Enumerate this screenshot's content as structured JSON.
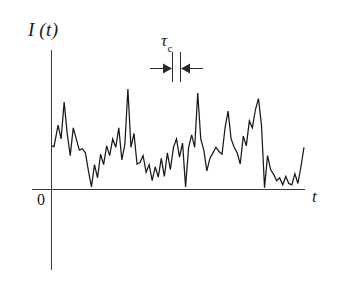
{
  "figure": {
    "background_color": "#ffffff",
    "axis_color": "#3a3a3a",
    "trace_color": "#1a1a1a",
    "labels": {
      "y_axis": "I (t)",
      "x_axis": "t",
      "origin": "0",
      "tau_symbol": "τ",
      "tau_subscript": "c"
    }
  },
  "chart_data": {
    "type": "line",
    "title": "",
    "xlabel": "t",
    "ylabel": "I (t)",
    "subtitle": "",
    "grid": false,
    "legend": null,
    "xlim": [
      0,
      100
    ],
    "ylim": [
      0,
      100
    ],
    "annotations": [
      {
        "label": "τc",
        "description": "coherence time interval marked between two vertical bars with inward-pointing arrows",
        "x_start": 57.0,
        "x_end": 60.3,
        "y": 96
      }
    ],
    "series": [
      {
        "name": "I(t)",
        "x": [
          0.0,
          0.8,
          2.4,
          3.6,
          4.8,
          6.0,
          7.2,
          8.4,
          9.6,
          10.8,
          12.0,
          13.2,
          14.4,
          15.6,
          16.8,
          18.0,
          19.2,
          20.4,
          21.6,
          22.8,
          24.0,
          25.2,
          26.4,
          27.6,
          28.8,
          30.0,
          31.2,
          32.4,
          33.6,
          34.8,
          36.0,
          37.2,
          38.4,
          39.6,
          40.8,
          42.0,
          43.2,
          44.4,
          45.6,
          46.8,
          48.0,
          49.2,
          50.4,
          51.6,
          52.8,
          54.0,
          55.2,
          56.4,
          57.6,
          58.8,
          60.0,
          61.2,
          62.4,
          63.6,
          64.8,
          66.0,
          67.2,
          68.4,
          69.6,
          70.8,
          72.0,
          73.2,
          74.4,
          75.6,
          76.8,
          78.0,
          79.2,
          80.4,
          81.6,
          82.8,
          84.0,
          85.2,
          86.4,
          87.6,
          88.8,
          90.0,
          91.2,
          92.4,
          93.6,
          94.8,
          96.0,
          97.2,
          98.4,
          99.6
        ],
        "y": [
          31.0,
          30.5,
          46.0,
          36.0,
          62.5,
          40.0,
          24.0,
          44.0,
          36.0,
          28.0,
          29.0,
          26.0,
          13.0,
          1.5,
          17.5,
          8.0,
          25.0,
          17.5,
          31.0,
          24.0,
          36.0,
          30.0,
          44.0,
          21.0,
          32.0,
          72.0,
          30.0,
          40.0,
          18.0,
          19.0,
          24.0,
          12.0,
          17.5,
          6.0,
          16.0,
          8.5,
          22.0,
          9.0,
          26.0,
          14.0,
          30.0,
          36.0,
          23.0,
          33.0,
          1.5,
          30.0,
          39.0,
          30.0,
          69.0,
          36.0,
          28.0,
          13.0,
          22.0,
          26.0,
          30.0,
          27.0,
          25.0,
          44.0,
          56.0,
          36.0,
          30.0,
          26.0,
          18.0,
          38.0,
          31.0,
          49.0,
          44.0,
          57.0,
          65.0,
          46.0,
          1.0,
          24.0,
          14.0,
          10.5,
          6.0,
          8.0,
          3.0,
          9.0,
          4.0,
          3.0,
          11.0,
          4.0,
          16.0,
          30.0
        ]
      }
    ]
  },
  "geometry": {
    "plot_left": 52,
    "plot_right": 305,
    "baseline_y": 189,
    "top_y": 50,
    "axis_bottom_y": 270,
    "tau_bar_left_x": 172,
    "tau_bar_right_x": 180,
    "tau_bar_top_y": 52,
    "tau_bar_bottom_y": 82,
    "tau_arrow_y": 68,
    "tau_arrow_left_start_x": 150,
    "tau_arrow_right_start_x": 202
  }
}
